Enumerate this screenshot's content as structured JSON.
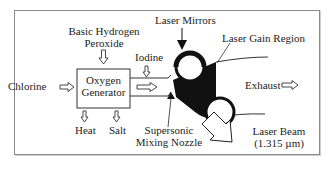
{
  "diagram": {
    "labels": {
      "chlorine": "Chlorine",
      "basic_hydrogen_peroxide_line1": "Basic Hydrogen",
      "basic_hydrogen_peroxide_line2": "Peroxide",
      "iodine": "Iodine",
      "oxygen_generator_line1": "Oxygen",
      "oxygen_generator_line2": "Generator",
      "heat": "Heat",
      "salt": "Salt",
      "laser_mirrors": "Laser Mirrors",
      "laser_gain_region": "Laser Gain Region",
      "exhaust": "Exhaust",
      "supersonic_line1": "Supersonic",
      "mixing_nozzle_line2": "Mixing Nozzle",
      "laser_beam_line1": "Laser Beam",
      "laser_beam_line2": "(1.315 µm)"
    },
    "colors": {
      "line": "#222222",
      "fill_dark": "#111111",
      "frame": "#8a8a8a",
      "background": "#ffffff"
    }
  }
}
